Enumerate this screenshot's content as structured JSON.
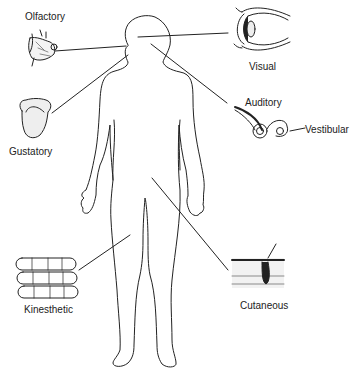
{
  "diagram": {
    "senses": [
      {
        "id": "olfactory",
        "label": "Olfactory",
        "icon": "nose-icon"
      },
      {
        "id": "visual",
        "label": "Visual",
        "icon": "eye-icon"
      },
      {
        "id": "auditory",
        "label": "Auditory",
        "icon": "ear-cochlea-icon"
      },
      {
        "id": "vestibular",
        "label": "Vestibular",
        "icon": "semicircular-canals-icon"
      },
      {
        "id": "gustatory",
        "label": "Gustatory",
        "icon": "tongue-icon"
      },
      {
        "id": "kinesthetic",
        "label": "Kinesthetic",
        "icon": "muscle-fibers-icon"
      },
      {
        "id": "cutaneous",
        "label": "Cutaneous",
        "icon": "skin-section-icon"
      }
    ],
    "colors": {
      "line": "#222222",
      "background": "#ffffff"
    }
  }
}
